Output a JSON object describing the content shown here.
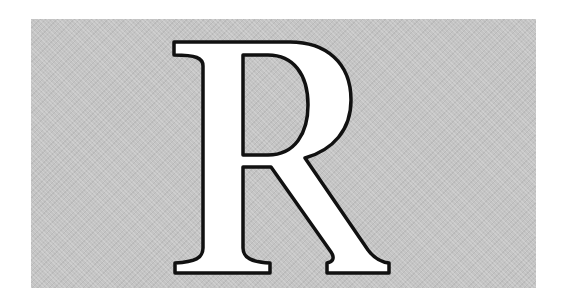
{
  "image": {
    "letter": "R",
    "description": "Large white serif capital letter with black outline on gray textured panel"
  },
  "colors": {
    "page_background": "#ffffff",
    "panel_background": "#c4c4c4",
    "letter_fill": "#ffffff",
    "letter_stroke": "#111111"
  }
}
